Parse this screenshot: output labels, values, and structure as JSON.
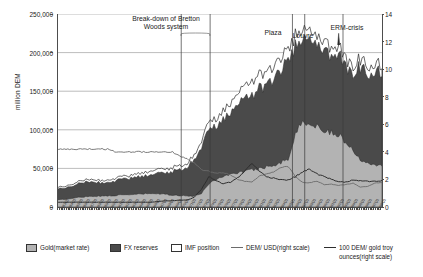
{
  "chart_data": {
    "type": "area",
    "title": "",
    "subtitle": "",
    "ylabel": "million DEM",
    "xlabel": "",
    "ylim": [
      0,
      250000
    ],
    "y2lim": [
      0,
      14
    ],
    "grid": true,
    "legend_position": "bottom",
    "left_axis_ticks": [
      "250,000",
      "200,000",
      "150,000",
      "100,000",
      "50,000",
      "0"
    ],
    "left_axis_values": [
      250000,
      200000,
      150000,
      100000,
      50000,
      0
    ],
    "right_axis_ticks": [
      "14",
      "12",
      "10",
      "8",
      "6",
      "4",
      "2",
      "0"
    ],
    "right_axis_values": [
      14,
      12,
      10,
      8,
      6,
      4,
      2,
      0
    ],
    "x": [
      "1953Q1",
      "1954Q1",
      "1955Q1",
      "1956Q1",
      "1957Q1",
      "1958Q1",
      "1959Q1",
      "1960Q1",
      "1961Q1",
      "1962Q1",
      "1963Q1",
      "1964Q1",
      "1965Q1",
      "1966Q1",
      "1967Q1",
      "1968Q1",
      "1969Q1",
      "1970Q1",
      "1971Q1",
      "1972Q1",
      "1973Q1",
      "1974Q1",
      "1975Q1",
      "1976Q1",
      "1977Q1",
      "1978Q1",
      "1979Q1",
      "1980Q1",
      "1981Q1",
      "1982Q1",
      "1983Q1",
      "1984Q1",
      "1985Q1",
      "1986Q1",
      "1987Q1",
      "1988Q1",
      "1989Q1",
      "1990Q1",
      "1991Q1",
      "1992Q1",
      "1993Q1",
      "1994Q1",
      "1995Q1",
      "1996Q1",
      "1997Q1",
      "1998Q1"
    ],
    "series": [
      {
        "name": "Gold(market rate)",
        "type": "area-stacked",
        "color": "#b3b3b3",
        "axis": "left",
        "values": [
          9000,
          10000,
          11000,
          12500,
          13500,
          14000,
          14000,
          14500,
          15000,
          15500,
          16000,
          16500,
          17000,
          17500,
          17000,
          16500,
          15500,
          15000,
          14500,
          14000,
          18000,
          30000,
          36000,
          40000,
          42000,
          45000,
          46000,
          48000,
          50000,
          52000,
          55000,
          58000,
          62000,
          95000,
          110000,
          108000,
          104000,
          100000,
          97000,
          93000,
          85000,
          72000,
          62000,
          58000,
          56000,
          54000
        ]
      },
      {
        "name": "FX reserves",
        "type": "area-stacked",
        "color": "#4a4a4a",
        "axis": "left",
        "values": [
          14000,
          14500,
          15500,
          17500,
          19500,
          19000,
          17000,
          17500,
          19000,
          20500,
          21000,
          22000,
          23000,
          24000,
          26000,
          28000,
          31000,
          34000,
          36000,
          48000,
          62000,
          68000,
          70000,
          74000,
          78000,
          86000,
          92000,
          98000,
          106000,
          104000,
          112000,
          122000,
          128000,
          112000,
          104000,
          112000,
          106000,
          108000,
          96000,
          104000,
          98000,
          102000,
          120000,
          118000,
          120000,
          122000
        ]
      },
      {
        "name": "IMF position",
        "type": "area-stacked",
        "color": "#ffffff",
        "axis": "left",
        "values": [
          2000,
          2200,
          2500,
          2800,
          3000,
          3000,
          3000,
          3000,
          3200,
          3500,
          3500,
          4000,
          4500,
          5000,
          5000,
          5000,
          5000,
          5000,
          5000,
          6000,
          8000,
          10000,
          10000,
          11000,
          12000,
          14000,
          16000,
          18000,
          18000,
          16000,
          16000,
          16000,
          14000,
          14000,
          12000,
          12000,
          10000,
          12000,
          10000,
          10000,
          10000,
          10000,
          10000,
          10000,
          10000,
          10000
        ]
      },
      {
        "name": "DEM/ USD(right scale)",
        "type": "line",
        "color": "#6b6b6b",
        "axis": "right",
        "values": [
          4.2,
          4.2,
          4.2,
          4.2,
          4.2,
          4.2,
          4.2,
          4.2,
          4.0,
          4.0,
          4.0,
          4.0,
          4.0,
          4.0,
          4.0,
          4.0,
          4.0,
          3.66,
          3.5,
          3.2,
          2.7,
          2.6,
          2.45,
          2.5,
          2.35,
          2.0,
          1.85,
          1.8,
          2.25,
          2.4,
          2.55,
          2.85,
          2.95,
          2.2,
          1.8,
          1.75,
          1.88,
          1.62,
          1.66,
          1.56,
          1.62,
          1.73,
          1.43,
          1.5,
          1.73,
          1.76
        ]
      },
      {
        "name": "100 DEM/ gold troy ounces(right scale)",
        "type": "line",
        "color": "#2e2e2e",
        "axis": "right",
        "values": [
          0.35,
          0.35,
          0.35,
          0.35,
          0.35,
          0.35,
          0.35,
          0.35,
          0.35,
          0.35,
          0.35,
          0.35,
          0.35,
          0.35,
          0.4,
          0.45,
          0.45,
          0.5,
          0.5,
          0.7,
          1.3,
          2.2,
          1.9,
          1.7,
          1.8,
          2.1,
          2.6,
          3.2,
          2.6,
          2.2,
          2.1,
          2.0,
          1.95,
          2.2,
          2.55,
          2.75,
          2.4,
          2.2,
          2.0,
          1.85,
          1.8,
          1.95,
          1.9,
          1.85,
          1.85,
          1.9
        ]
      }
    ],
    "annotations": [
      {
        "label": "Break-down of Bretton\nWoods system",
        "line1": "Break-down of Bretton",
        "line2": "Woods system"
      },
      {
        "label": "Plaza"
      },
      {
        "label": "Louvre"
      },
      {
        "label": "ERM-crisis"
      }
    ]
  },
  "axes": {
    "left_title": "million DEM",
    "left_ticks": [
      "250,000",
      "200,000",
      "150,000",
      "100,000",
      "50,000",
      "0"
    ],
    "right_ticks": [
      "14",
      "12",
      "10",
      "8",
      "6",
      "4",
      "2",
      "0"
    ]
  },
  "annotations": {
    "bretton_line1": "Break-down of Bretton",
    "bretton_line2": "Woods system",
    "plaza": "Plaza",
    "louvre": "Louvre",
    "erm": "ERM-crisis"
  },
  "legend": {
    "items": [
      {
        "label": "Gold(market rate)",
        "marker": "swatch-gold"
      },
      {
        "label": "FX reserves",
        "marker": "swatch-fx"
      },
      {
        "label": "IMF position",
        "marker": "swatch-imf"
      },
      {
        "label": "DEM/ USD(right scale)",
        "marker": "line-light"
      },
      {
        "label": "100 DEM/ gold troy",
        "label2": "ounces(right scale)",
        "marker": "line-dark"
      }
    ]
  },
  "colors": {
    "gold": "#b3b3b3",
    "fx_reserves": "#4a4a4a",
    "imf_position": "#ffffff",
    "dem_usd_line": "#6b6b6b",
    "gold_line": "#2e2e2e",
    "grid": "#8f8f8f",
    "axis": "#4d4d4d"
  }
}
